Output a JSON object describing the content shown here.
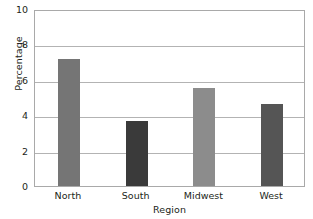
{
  "chart_data": {
    "type": "bar",
    "title": "",
    "subtitle": "",
    "xlabel": "Region",
    "ylabel": "Percentage",
    "categories": [
      "North",
      "South",
      "Midwest",
      "West"
    ],
    "values": [
      7.2,
      3.7,
      5.55,
      4.65
    ],
    "series": [
      {
        "name": "Percentage",
        "values": [
          7.2,
          3.7,
          5.55,
          4.65
        ]
      }
    ],
    "bar_colors": [
      "#757575",
      "#3a3a3a",
      "#8c8c8c",
      "#555555"
    ],
    "ylim": [
      0,
      10
    ],
    "ytick_labels": [
      "0",
      "2",
      "4",
      "6",
      "8",
      "10"
    ],
    "ytick_values": [
      0,
      2,
      4,
      6,
      8,
      10
    ],
    "xlim_categories": 4,
    "grid": "horizontal",
    "legend": "none",
    "annotations": [],
    "plot_border_color": "#a9a9a9",
    "gridline_color": "#b3b3b3",
    "background_color": "#ffffff",
    "text_color": "#231f20"
  }
}
